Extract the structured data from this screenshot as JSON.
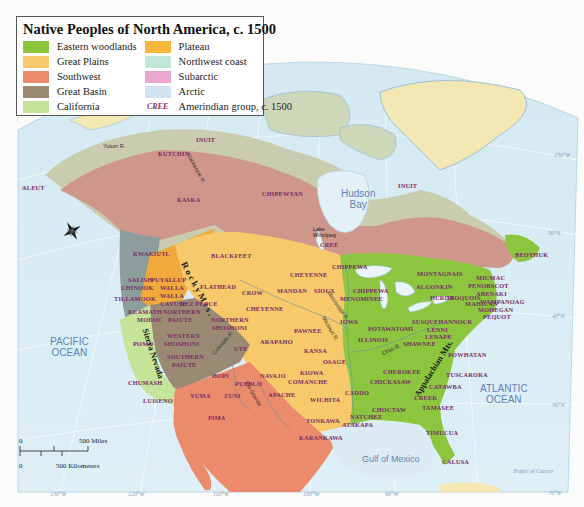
{
  "map": {
    "title": "Native Peoples of North America, c. 1500",
    "legend": {
      "items": [
        {
          "label": "Eastern woodlands",
          "color": "#8cc63f"
        },
        {
          "label": "Plateau",
          "color": "#f6b93b"
        },
        {
          "label": "Great Plains",
          "color": "#f7c96a"
        },
        {
          "label": "Northwest coast",
          "color": "#bfe6d6"
        },
        {
          "label": "Southwest",
          "color": "#ec8a6c"
        },
        {
          "label": "Subarctic",
          "color": "#e9a6cf"
        },
        {
          "label": "Great Basin",
          "color": "#9a8a74"
        },
        {
          "label": "Arctic",
          "color": "#cfe3f2"
        },
        {
          "label": "California",
          "color": "#c6e39a"
        }
      ],
      "group_sample": "CREE",
      "group_label": "Amerindian group, c. 1500"
    },
    "oceans": {
      "pacific": "PACIFIC\nOCEAN",
      "atlantic": "ATLANTIC\nOCEAN",
      "hudson": "Hudson\nBay",
      "gulf": "Gulf of Mexico"
    },
    "mountains": {
      "rocky": "R o c k y   M t s .",
      "sierra": "Sierra Nevada",
      "appalachian": "Appalachian Mts."
    },
    "rivers": {
      "yukon": "Yukon R.",
      "mackenzie": "Mackenzie R.",
      "mississippi": "Mississippi R.",
      "missouri": "Missouri R.",
      "ohio": "Ohio R.",
      "colorado": "Colorado R.",
      "rio_grande": "Rio Grande",
      "st_lawrence": "St. Lawrence R."
    },
    "lakes": {
      "winnipeg": "Lake\nWinnipeg",
      "superior": "L. Superior",
      "michigan": "L. Michigan",
      "huron": "L. Huron",
      "erie": "L. Erie",
      "ontario": "L. Ontario"
    },
    "tribes": [
      {
        "name": "ALEUT",
        "x": 22,
        "y": 184
      },
      {
        "name": "KUTCHIN",
        "x": 158,
        "y": 150
      },
      {
        "name": "INUIT",
        "x": 196,
        "y": 136
      },
      {
        "name": "INUIT",
        "x": 398,
        "y": 182
      },
      {
        "name": "KASKA",
        "x": 177,
        "y": 196
      },
      {
        "name": "CHIPEWYAN",
        "x": 262,
        "y": 190
      },
      {
        "name": "CREE",
        "x": 320,
        "y": 241
      },
      {
        "name": "BEOTHUK",
        "x": 515,
        "y": 251
      },
      {
        "name": "KWAKIUTL",
        "x": 133,
        "y": 250
      },
      {
        "name": "BLACKFEET",
        "x": 211,
        "y": 252
      },
      {
        "name": "SALISH",
        "x": 128,
        "y": 276
      },
      {
        "name": "CHINOOK",
        "x": 121,
        "y": 284
      },
      {
        "name": "PUYALLUP",
        "x": 151,
        "y": 276
      },
      {
        "name": "WALLA",
        "x": 160,
        "y": 284
      },
      {
        "name": "WALLA",
        "x": 160,
        "y": 292
      },
      {
        "name": "CAYUSE",
        "x": 160,
        "y": 300
      },
      {
        "name": "NEZ PERCE",
        "x": 180,
        "y": 300
      },
      {
        "name": "FLATHEAD",
        "x": 200,
        "y": 283
      },
      {
        "name": "TILLAMOOK",
        "x": 114,
        "y": 295
      },
      {
        "name": "KLAMATH",
        "x": 128,
        "y": 308
      },
      {
        "name": "MODOC",
        "x": 137,
        "y": 316
      },
      {
        "name": "NORTHERN",
        "x": 163,
        "y": 308
      },
      {
        "name": "PAIUTE",
        "x": 168,
        "y": 316
      },
      {
        "name": "CROW",
        "x": 242,
        "y": 289
      },
      {
        "name": "MANDAN",
        "x": 277,
        "y": 287
      },
      {
        "name": "CHEYENNE",
        "x": 290,
        "y": 271
      },
      {
        "name": "CHEYENNE",
        "x": 246,
        "y": 305
      },
      {
        "name": "SIOUX",
        "x": 314,
        "y": 287
      },
      {
        "name": "CHIPPEWA",
        "x": 332,
        "y": 263
      },
      {
        "name": "NORTHERN",
        "x": 211,
        "y": 316
      },
      {
        "name": "SHOSHONI",
        "x": 212,
        "y": 324
      },
      {
        "name": "POMO",
        "x": 133,
        "y": 340
      },
      {
        "name": "WESTERN",
        "x": 167,
        "y": 332
      },
      {
        "name": "SHOSHONI",
        "x": 164,
        "y": 340
      },
      {
        "name": "SOUTHERN",
        "x": 167,
        "y": 353
      },
      {
        "name": "PAIUTE",
        "x": 172,
        "y": 361
      },
      {
        "name": "UTE",
        "x": 234,
        "y": 345
      },
      {
        "name": "ARAPAHO",
        "x": 260,
        "y": 338
      },
      {
        "name": "PAWNEE",
        "x": 294,
        "y": 327
      },
      {
        "name": "KANSA",
        "x": 304,
        "y": 347
      },
      {
        "name": "OSAGE",
        "x": 323,
        "y": 358
      },
      {
        "name": "IOWA",
        "x": 340,
        "y": 318
      },
      {
        "name": "CHIPPEWA",
        "x": 353,
        "y": 287
      },
      {
        "name": "MENOMINEE",
        "x": 340,
        "y": 295
      },
      {
        "name": "MONTAGNAIS",
        "x": 417,
        "y": 270
      },
      {
        "name": "ALGONKIN",
        "x": 416,
        "y": 283
      },
      {
        "name": "MICMAC",
        "x": 476,
        "y": 274
      },
      {
        "name": "PENOBSCOT",
        "x": 468,
        "y": 282
      },
      {
        "name": "ABENAKI",
        "x": 476,
        "y": 290
      },
      {
        "name": "HURON",
        "x": 430,
        "y": 294
      },
      {
        "name": "IROQUOIS",
        "x": 447,
        "y": 294
      },
      {
        "name": "MAHICAN",
        "x": 465,
        "y": 300
      },
      {
        "name": "WAMPANOAG",
        "x": 480,
        "y": 298
      },
      {
        "name": "MOHEGAN",
        "x": 478,
        "y": 306
      },
      {
        "name": "PEQUOT",
        "x": 483,
        "y": 313
      },
      {
        "name": "POTAWATOMI",
        "x": 368,
        "y": 325
      },
      {
        "name": "SUSQUEHANNOCK",
        "x": 412,
        "y": 318
      },
      {
        "name": "LENNI",
        "x": 427,
        "y": 326
      },
      {
        "name": "LENAPE",
        "x": 425,
        "y": 333
      },
      {
        "name": "ILLINOIS",
        "x": 358,
        "y": 336
      },
      {
        "name": "SHAWNEE",
        "x": 403,
        "y": 340
      },
      {
        "name": "POWHATAN",
        "x": 448,
        "y": 351
      },
      {
        "name": "CHUMASH",
        "x": 128,
        "y": 379
      },
      {
        "name": "LUISENO",
        "x": 143,
        "y": 397
      },
      {
        "name": "HOPI",
        "x": 212,
        "y": 372
      },
      {
        "name": "NAVAJO",
        "x": 260,
        "y": 372
      },
      {
        "name": "PUEBLO",
        "x": 235,
        "y": 380
      },
      {
        "name": "COMANCHE",
        "x": 288,
        "y": 378
      },
      {
        "name": "KIOWA",
        "x": 300,
        "y": 369
      },
      {
        "name": "APACHE",
        "x": 268,
        "y": 391
      },
      {
        "name": "YUMA",
        "x": 190,
        "y": 392
      },
      {
        "name": "ZUNI",
        "x": 224,
        "y": 392
      },
      {
        "name": "WICHITA",
        "x": 310,
        "y": 396
      },
      {
        "name": "CADDO",
        "x": 345,
        "y": 389
      },
      {
        "name": "CHEROKEE",
        "x": 383,
        "y": 368
      },
      {
        "name": "CHICKASAW",
        "x": 370,
        "y": 378
      },
      {
        "name": "CATAWBA",
        "x": 429,
        "y": 383
      },
      {
        "name": "TUSCARORA",
        "x": 446,
        "y": 371
      },
      {
        "name": "CREEK",
        "x": 414,
        "y": 394
      },
      {
        "name": "PIMA",
        "x": 208,
        "y": 414
      },
      {
        "name": "TONKAWA",
        "x": 306,
        "y": 417
      },
      {
        "name": "NATCHEZ",
        "x": 350,
        "y": 413
      },
      {
        "name": "ATAKAPA",
        "x": 342,
        "y": 421
      },
      {
        "name": "CHOCTAW",
        "x": 372,
        "y": 406
      },
      {
        "name": "TAMASEE",
        "x": 422,
        "y": 404
      },
      {
        "name": "KARANKAWA",
        "x": 299,
        "y": 434
      },
      {
        "name": "TIMUCUA",
        "x": 426,
        "y": 429
      },
      {
        "name": "CALUSA",
        "x": 442,
        "y": 458
      }
    ],
    "coordinates": [
      {
        "label": "150°W",
        "x": 554,
        "y": 152
      },
      {
        "label": "50°N",
        "x": 548,
        "y": 230
      },
      {
        "label": "40°N",
        "x": 552,
        "y": 313
      },
      {
        "label": "30°N",
        "x": 552,
        "y": 402
      },
      {
        "label": "70°W",
        "x": 548,
        "y": 490
      },
      {
        "label": "Tropic of Cancer",
        "x": 513,
        "y": 468
      },
      {
        "label": "130°W",
        "x": 50,
        "y": 491
      },
      {
        "label": "120°W",
        "x": 128,
        "y": 491
      },
      {
        "label": "110°W",
        "x": 213,
        "y": 491
      },
      {
        "label": "100°W",
        "x": 303,
        "y": 491
      },
      {
        "label": "90°W",
        "x": 385,
        "y": 491
      }
    ],
    "scale": {
      "zero_top": "0",
      "miles": "500 Miles",
      "zero_bottom": "0",
      "km": "500 Kilometers"
    }
  }
}
